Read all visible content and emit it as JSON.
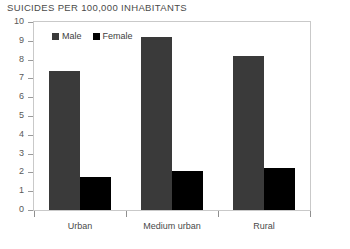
{
  "chart_data": {
    "type": "bar",
    "title": "SUICIDES PER 100,000 INHABITANTS",
    "xlabel": "",
    "ylabel": "",
    "ylim": [
      0,
      10
    ],
    "ytick_step": 1,
    "yticks": [
      "10",
      "9",
      "8",
      "7",
      "6",
      "5",
      "4",
      "3",
      "2",
      "1",
      "0"
    ],
    "grid": false,
    "legend_position": "top-left-inside",
    "categories": [
      "Urban",
      "Medium urban",
      "Rural"
    ],
    "series": [
      {
        "name": "Male",
        "color": "#3a3a3a",
        "values": [
          7.4,
          9.2,
          8.2
        ]
      },
      {
        "name": "Female",
        "color": "#000000",
        "values": [
          1.75,
          2.1,
          2.25
        ]
      }
    ]
  },
  "legend": {
    "items": [
      {
        "label": "Male",
        "color": "#3a3a3a"
      },
      {
        "label": "Female",
        "color": "#000000"
      }
    ]
  },
  "colors": {
    "male": "#3a3a3a",
    "female": "#000000",
    "frame": "#c9c9c9",
    "text": "#4a4a4a",
    "tick": "#9a9a9a"
  }
}
